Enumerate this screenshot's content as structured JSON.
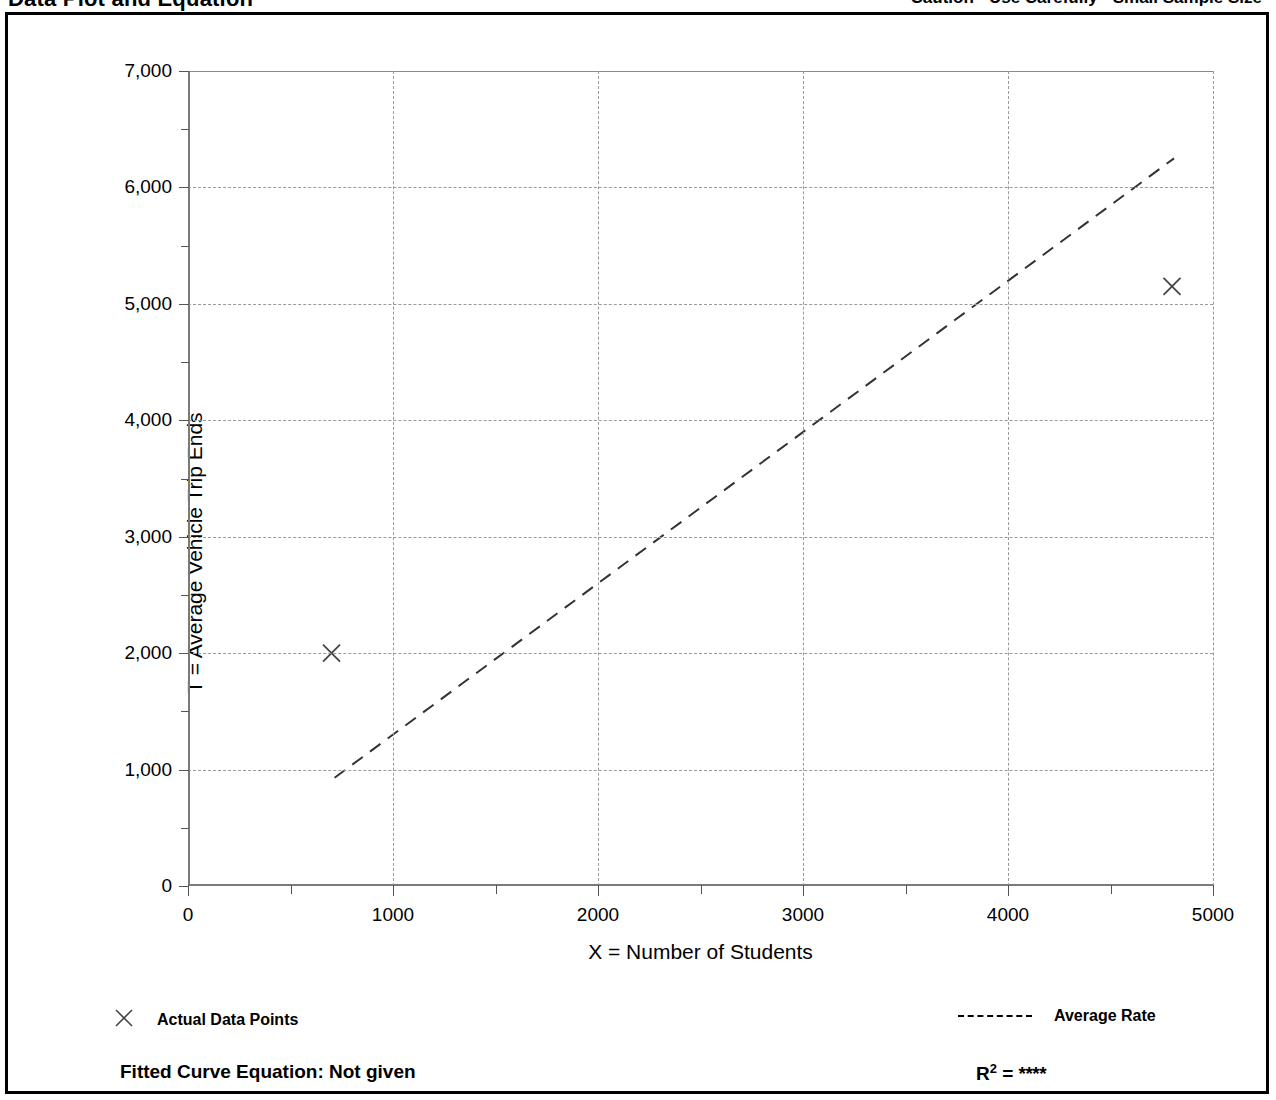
{
  "header": {
    "title": "Data Plot and Equation",
    "caution": "Caution - Use Carefully - Small Sample Size"
  },
  "legend": {
    "data_points_marker": "x-marker-icon",
    "data_points_label": "Actual Data Points",
    "average_rate_marker": "dashed-line-icon",
    "average_rate_label": "Average Rate"
  },
  "footer": {
    "fitted_equation_label": "Fitted Curve Equation:  Not given",
    "r_squared_prefix": "R",
    "r_squared_exponent": "2",
    "r_squared_equals": " = ",
    "r_squared_value": "****"
  },
  "chart_data": {
    "type": "scatter",
    "title": "Data Plot and Equation",
    "xlabel": "X = Number of Students",
    "ylabel": "T = Average Vehicle Trip Ends",
    "xlim": [
      0,
      5000
    ],
    "ylim": [
      0,
      7000
    ],
    "xticks": [
      0,
      1000,
      2000,
      3000,
      4000,
      5000
    ],
    "xtick_labels": [
      "0",
      "1000",
      "2000",
      "3000",
      "4000",
      "5000"
    ],
    "yticks": [
      0,
      1000,
      2000,
      3000,
      4000,
      5000,
      6000,
      7000
    ],
    "ytick_labels": [
      "0",
      "1,000",
      "2,000",
      "3,000",
      "4,000",
      "5,000",
      "6,000",
      "7,000"
    ],
    "x_minor_ticks": [
      500,
      1500,
      2500,
      3500,
      4500
    ],
    "y_minor_ticks": [
      500,
      1500,
      2500,
      3500,
      4500,
      5500,
      6500
    ],
    "grid": true,
    "grid_style": "dotted",
    "legend_position": "below-plot",
    "series": [
      {
        "name": "Actual Data Points",
        "type": "scatter",
        "marker": "x",
        "color": "#444444",
        "points": [
          {
            "x": 700,
            "y": 2000
          },
          {
            "x": 4800,
            "y": 5150
          }
        ]
      },
      {
        "name": "Average Rate",
        "type": "line",
        "style": "dashed",
        "color": "#333333",
        "slope": 1.3,
        "intercept": 0,
        "points": [
          {
            "x": 715,
            "y": 930
          },
          {
            "x": 4810,
            "y": 6250
          }
        ]
      }
    ]
  }
}
